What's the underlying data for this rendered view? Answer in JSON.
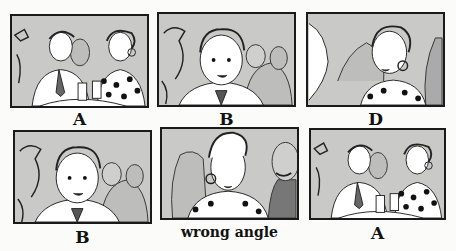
{
  "storyboard": {
    "panels": [
      {
        "id": "panel-1",
        "caption": "A",
        "shot": "two-shot: man in tie and woman in polka-dot dress at table with glasses"
      },
      {
        "id": "panel-2",
        "caption": "B",
        "shot": "close-up: young man, crowd behind"
      },
      {
        "id": "panel-3",
        "caption": "D",
        "shot": "close-up: woman with earring, profile of person in foreground"
      },
      {
        "id": "panel-4",
        "caption": "B",
        "shot": "close-up: young man, crowd behind"
      },
      {
        "id": "panel-5",
        "caption": "wrong angle",
        "shot": "close-up: woman with earring, bald mustached man behind"
      },
      {
        "id": "panel-6",
        "caption": "A",
        "shot": "two-shot: man in tie and woman in polka-dot dress at table with glasses"
      }
    ]
  },
  "colors": {
    "background": "#fbfbfa",
    "panel_fill": "#c9c9c7",
    "ink": "#1a1a1a"
  }
}
